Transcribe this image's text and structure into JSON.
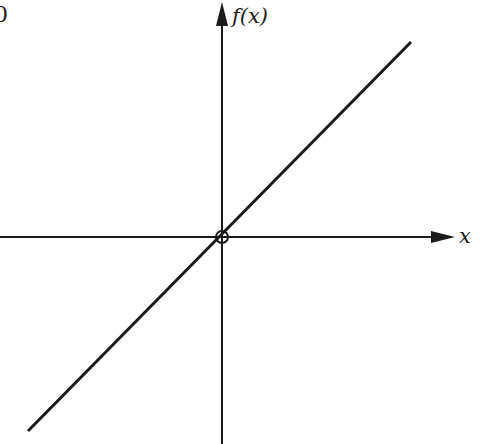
{
  "diagram": {
    "type": "function-graph",
    "y_axis_label": "f(x)",
    "x_axis_label": "x",
    "corner_fragment": "0",
    "origin_marker": "open-circle",
    "line": {
      "from": [
        28,
        431
      ],
      "to": [
        411,
        42
      ],
      "slope": "1 (45 degrees)"
    },
    "colors": {
      "ink": "#1a1a1a",
      "background": "#ffffff"
    }
  }
}
